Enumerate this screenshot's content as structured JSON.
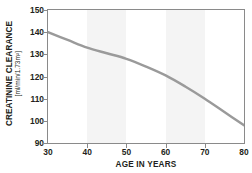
{
  "chart_data": {
    "type": "line",
    "title": "",
    "xlabel": "AGE IN YEARS",
    "ylabel": "CREATININE CLEARANCE",
    "ylabel_units": "[ml/min/1.73m²]",
    "x": [
      30,
      35,
      40,
      45,
      50,
      55,
      60,
      65,
      70,
      75,
      80
    ],
    "values": [
      140,
      136.5,
      133,
      130.5,
      128,
      124.5,
      120.5,
      115.5,
      110,
      104,
      98
    ],
    "series": [
      {
        "name": "Creatinine clearance",
        "values": [
          140,
          136.5,
          133,
          130.5,
          128,
          124.5,
          120.5,
          115.5,
          110,
          104,
          98
        ],
        "color": "#9a9a9a"
      }
    ],
    "xlim": [
      30,
      80
    ],
    "ylim": [
      90,
      150
    ],
    "xticks": [
      30,
      40,
      50,
      60,
      70,
      80
    ],
    "yticks": [
      90,
      100,
      110,
      120,
      130,
      140,
      150
    ],
    "xtick_labels": [
      "30",
      "40",
      "50",
      "60",
      "70",
      "80"
    ],
    "ytick_labels": [
      "90",
      "100",
      "110",
      "120",
      "130",
      "140",
      "150"
    ],
    "grid": false,
    "legend": false,
    "shaded_bands": [
      {
        "name": "band-40-50",
        "x0": 40,
        "x1": 50,
        "color": "#f4f4f4"
      },
      {
        "name": "band-60-70",
        "x0": 60,
        "x1": 70,
        "color": "#f4f4f4"
      }
    ],
    "line_color": "#9a9a9a",
    "frame_color": "#8a8a8a",
    "background": "#ffffff",
    "text_color": "#231f20"
  }
}
